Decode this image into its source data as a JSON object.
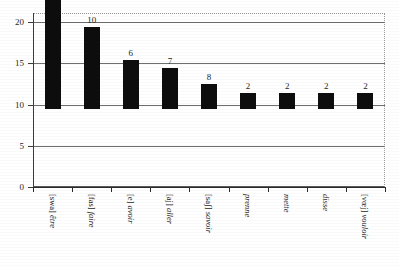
{
  "chart_data": {
    "type": "bar",
    "title": "",
    "subtitle": "",
    "xlabel": "",
    "ylabel": "",
    "ylim": [
      0,
      20
    ],
    "yticks": [
      0,
      5,
      10,
      15,
      20
    ],
    "grid": "horizontal",
    "legend": "none",
    "orientation": "vertical",
    "bar_color": "#0d0d0d",
    "categories": [
      "[swa] être",
      "[fas] faire",
      "[e] avoir",
      "[aj] aller",
      "[saʃ] savoir",
      "prenne",
      "mette",
      "disse",
      "[vœj] vouloir"
    ],
    "ipa": [
      "[swa]",
      "[fas]",
      "[e]",
      "[aj]",
      "[saʃ]",
      "",
      "",
      "",
      "[vœj]"
    ],
    "words": [
      "être",
      "faire",
      "avoir",
      "aller",
      "savoir",
      "prenne",
      "mette",
      "disse",
      "vouloir"
    ],
    "values": [
      20,
      10,
      6,
      7,
      8,
      2,
      2,
      2,
      2
    ],
    "drawn_heights": [
      20,
      10,
      6,
      5,
      3,
      2,
      2,
      2,
      2
    ],
    "data_labels": [
      "20",
      "10",
      "6",
      "7",
      "8",
      "2",
      "2",
      "2",
      "2"
    ],
    "ytick_labels": [
      "0",
      "5",
      "10",
      "15",
      "20"
    ]
  }
}
